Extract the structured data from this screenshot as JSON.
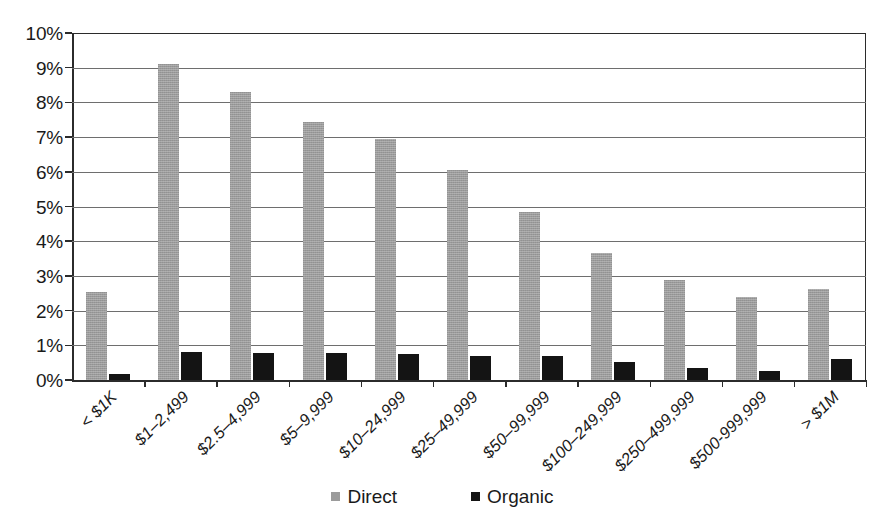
{
  "chart_data": {
    "type": "bar",
    "title": "",
    "subtitle": "",
    "xlabel": "",
    "ylabel": "",
    "ylim": [
      0,
      10
    ],
    "y_tick_labels": [
      "0%",
      "1%",
      "2%",
      "3%",
      "4%",
      "5%",
      "6%",
      "7%",
      "8%",
      "9%",
      "10%"
    ],
    "y_tick_values": [
      0,
      1,
      2,
      3,
      4,
      5,
      6,
      7,
      8,
      9,
      10
    ],
    "grid": "horizontal",
    "legend_position": "bottom-center",
    "x_tick_rotation": -45,
    "value_unit": "percent",
    "categories": [
      "< $1K",
      "$1–2,499",
      "$2.5–4,999",
      "$5–9,999",
      "$10–24,999",
      "$25–49,999",
      "$50–99,999",
      "$100–249,999",
      "$250–499,999",
      "$500-999,999",
      "> $1M"
    ],
    "series": [
      {
        "name": "Direct",
        "color": "#9b9b9b",
        "values": [
          2.55,
          9.1,
          8.3,
          7.45,
          6.95,
          6.05,
          4.85,
          3.65,
          2.87,
          2.4,
          2.62
        ]
      },
      {
        "name": "Organic",
        "color": "#141414",
        "values": [
          0.18,
          0.82,
          0.79,
          0.77,
          0.76,
          0.7,
          0.69,
          0.51,
          0.35,
          0.26,
          0.61
        ]
      }
    ]
  },
  "legend": {
    "items": [
      {
        "label": "Direct",
        "swatch": "legend-swatch-direct"
      },
      {
        "label": "Organic",
        "swatch": "legend-swatch-organic"
      }
    ]
  }
}
